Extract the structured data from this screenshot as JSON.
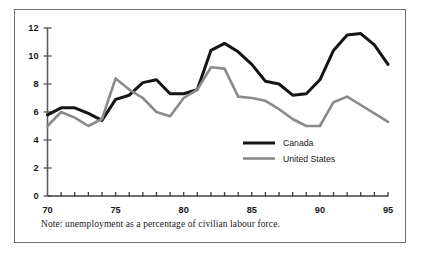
{
  "figure": {
    "note": "Note: unemployment as a percentage of civilian labour force."
  },
  "legend": {
    "entries": [
      {
        "label": "Canada",
        "color": "#141414"
      },
      {
        "label": "United States",
        "color": "#8a8a8a"
      }
    ]
  },
  "axes": {
    "y_ticks": [
      "0",
      "2",
      "4",
      "6",
      "8",
      "10",
      "12"
    ],
    "x_ticks_labeled": [
      "70",
      "75",
      "80",
      "85",
      "90",
      "95"
    ]
  },
  "chart_data": {
    "type": "line",
    "title": "",
    "subtitle": "",
    "xlabel": "",
    "ylabel": "",
    "xlim": [
      70,
      95
    ],
    "ylim": [
      0,
      12
    ],
    "grid": false,
    "legend_position": "inside-right-middle",
    "annotations": [
      "Note: unemployment as a percentage of civilian labour force."
    ],
    "x": [
      70,
      71,
      72,
      73,
      74,
      75,
      76,
      77,
      78,
      79,
      80,
      81,
      82,
      83,
      84,
      85,
      86,
      87,
      88,
      89,
      90,
      91,
      92,
      93,
      94,
      95
    ],
    "xtick_labels": [
      "70",
      "",
      "",
      "",
      "",
      "75",
      "",
      "",
      "",
      "",
      "80",
      "",
      "",
      "",
      "",
      "85",
      "",
      "",
      "",
      "",
      "90",
      "",
      "",
      "",
      "",
      "95"
    ],
    "ytick_values": [
      0,
      2,
      4,
      6,
      8,
      10,
      12
    ],
    "series": [
      {
        "name": "Canada",
        "color": "#141414",
        "width": 3.0,
        "values": [
          5.8,
          6.3,
          6.3,
          5.9,
          5.4,
          6.9,
          7.2,
          8.1,
          8.3,
          7.3,
          7.3,
          7.6,
          10.4,
          10.9,
          10.3,
          9.4,
          8.2,
          8.0,
          7.2,
          7.3,
          8.3,
          10.4,
          11.5,
          11.6,
          10.8,
          9.4
        ]
      },
      {
        "name": "United States",
        "color": "#8a8a8a",
        "width": 2.6,
        "values": [
          5.0,
          6.0,
          5.6,
          5.0,
          5.5,
          8.4,
          7.6,
          7.0,
          6.0,
          5.7,
          7.0,
          7.6,
          9.2,
          9.1,
          7.1,
          7.0,
          6.8,
          6.2,
          5.5,
          5.0,
          5.0,
          6.7,
          7.1,
          6.5,
          5.9,
          5.3
        ]
      }
    ]
  }
}
